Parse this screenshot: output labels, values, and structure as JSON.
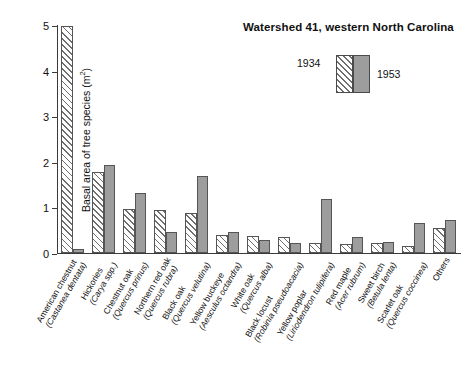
{
  "chart_data": {
    "type": "bar",
    "title": "Watershed 41, western North Carolina",
    "xlabel": "",
    "ylabel": "Basal area of tree species (m2)",
    "ylabel_text": "Basal area of tree species (m",
    "ylabel_sup": "2",
    "ylabel_tail": ")",
    "ylim": [
      0,
      5
    ],
    "yticks": [
      0,
      1,
      2,
      3,
      4,
      5
    ],
    "ytick_labels": [
      "0",
      "1",
      "2",
      "3",
      "4",
      "5"
    ],
    "grid": false,
    "legend_position": "top-center",
    "categories": [
      "American chestnut (Castanea dentata)",
      "Hickories (Carya spp.)",
      "Chestnut oak (Quercus prinus)",
      "Northern red oak (Quercus rubra)",
      "Black oak (Quercus velutina)",
      "Yellow buckeye (Aesculus octandra)",
      "White oak (Quercus alba)",
      "Black locust (Robinia pseudoacacia)",
      "Yellow poplar (Liriodendron tulipifera)",
      "Red maple (Acer rubrum)",
      "Sweet birch (Betula lenta)",
      "Scarlet oak (Quercus coccinea)",
      "Others"
    ],
    "category_parts": [
      {
        "common": "American chestnut",
        "scientific": "(Castanea dentata)"
      },
      {
        "common": "Hickories",
        "scientific": "(Carya spp.)"
      },
      {
        "common": "Chestnut oak",
        "scientific": "(Quercus prinus)"
      },
      {
        "common": "Northern red oak",
        "scientific": "(Quercus rubra)"
      },
      {
        "common": "Black oak",
        "scientific": "(Quercus velutina)"
      },
      {
        "common": "Yellow buckeye",
        "scientific": "(Aesculus octandra)"
      },
      {
        "common": "White oak",
        "scientific": "(Quercus alba)"
      },
      {
        "common": "Black locust",
        "scientific": "(Robinia pseudoacacia)"
      },
      {
        "common": "Yellow poplar",
        "scientific": "(Liriodendron tulipifera)"
      },
      {
        "common": "Red maple",
        "scientific": "(Acer rubrum)"
      },
      {
        "common": "Sweet birch",
        "scientific": "(Betula lenta)"
      },
      {
        "common": "Scarlet oak",
        "scientific": "(Quercus coccinea)"
      },
      {
        "common": "Others",
        "scientific": ""
      }
    ],
    "series": [
      {
        "name": "1934",
        "color": "#ffffff",
        "pattern": "diagonal-hatch",
        "values": [
          4.97,
          1.77,
          0.97,
          0.95,
          0.87,
          0.4,
          0.37,
          0.35,
          0.22,
          0.2,
          0.22,
          0.15,
          0.55
        ]
      },
      {
        "name": "1953",
        "color": "#9d9d9d",
        "pattern": "solid",
        "values": [
          0.08,
          1.93,
          1.31,
          0.45,
          1.68,
          0.47,
          0.28,
          0.23,
          1.18,
          0.35,
          0.25,
          0.65,
          0.73
        ]
      }
    ]
  },
  "legend": {
    "items": [
      {
        "label": "1934",
        "swatch": "hatched-swatch"
      },
      {
        "label": "1953",
        "swatch": "solid-gray-swatch"
      }
    ]
  }
}
